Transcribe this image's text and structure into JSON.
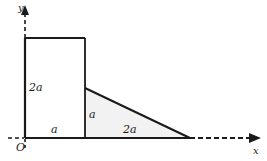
{
  "figure": {
    "background_color": "#ffffff",
    "stroke_color": "#1a1a1a",
    "triangle_fill_color": "#f2f2f2",
    "axes": {
      "x_label": "x",
      "y_label": "y",
      "origin_label": "O",
      "x_axis_solid_from": 25,
      "x_axis_solid_to": 190,
      "x_axis_dashed_to": 252,
      "y_axis_solid_from": 138,
      "y_axis_solid_to": 38,
      "y_axis_dashed_to": 12
    },
    "shapes": {
      "rectangle": {
        "name": "rectangle",
        "x": 25,
        "y": 38,
        "width": 60,
        "height": 100,
        "width_label": "a",
        "height_label": "2a"
      },
      "triangle": {
        "name": "right-triangle",
        "apex": [
          85,
          88
        ],
        "corner": [
          85,
          138
        ],
        "base_end": [
          190,
          138
        ],
        "vertical_leg_label": "a",
        "base_label": "2a"
      }
    },
    "labels": {
      "left_side": "2a",
      "inner_vertical": "a",
      "bottom_left": "a",
      "bottom_right": "2a"
    }
  }
}
